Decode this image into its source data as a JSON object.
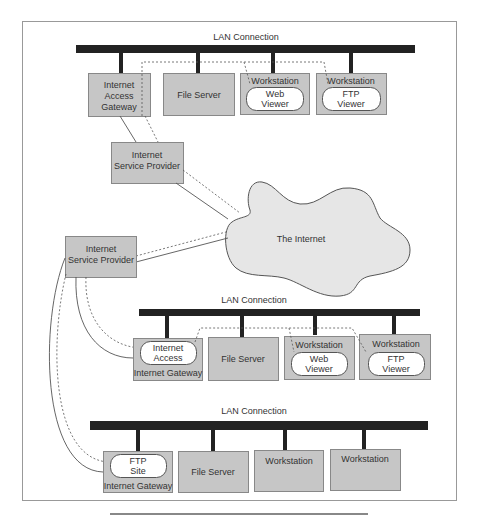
{
  "colors": {
    "box_fill": "#c6c6c6",
    "box_stroke": "#888888",
    "bus": "#222222",
    "cloud_fill": "#e6e6e6",
    "cloud_stroke": "#555555",
    "pill_fill": "#ffffff",
    "frame": "#999999",
    "link": "#555555"
  },
  "top_lan": {
    "label": "LAN Connection",
    "gateway": {
      "line1": "Internet",
      "line2": "Access",
      "line3": "Gateway"
    },
    "file_server": "File Server",
    "workstation_web": {
      "title": "Workstation",
      "pill_line1": "Web",
      "pill_line2": "Viewer"
    },
    "workstation_ftp": {
      "title": "Workstation",
      "pill_line1": "FTP",
      "pill_line2": "Viewer"
    }
  },
  "isp_top": {
    "line1": "Internet",
    "line2": "Service Provider"
  },
  "isp_bottom": {
    "line1": "Internet",
    "line2": "Service Provider"
  },
  "internet": {
    "label": "The Internet"
  },
  "middle_lan": {
    "label": "LAN Connection",
    "gateway": {
      "title": "Internet Gateway",
      "pill_line1": "Internet",
      "pill_line2": "Access"
    },
    "file_server": "File Server",
    "workstation_web": {
      "title": "Workstation",
      "pill_line1": "Web",
      "pill_line2": "Viewer"
    },
    "workstation_ftp": {
      "title": "Workstation",
      "pill_line1": "FTP",
      "pill_line2": "Viewer"
    }
  },
  "bottom_lan": {
    "label": "LAN Connection",
    "gateway": {
      "title": "Internet Gateway",
      "pill_line1": "FTP",
      "pill_line2": "Site"
    },
    "file_server": "File Server",
    "workstation_1": "Workstation",
    "workstation_2": "Workstation"
  }
}
